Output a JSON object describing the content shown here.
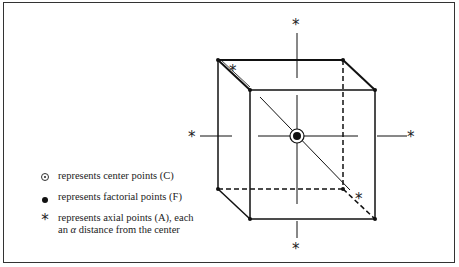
{
  "diagram": {
    "type": "central composite design cube",
    "center_point_label": "center",
    "axial_symbol": "*",
    "legend": [
      {
        "symbol": "center-point",
        "text": "represents center points (C)"
      },
      {
        "symbol": "factorial-point",
        "text": "represents factorial points (F)"
      },
      {
        "symbol": "axial-point",
        "line1": "represents axial points (A), each",
        "line2_prefix": "an ",
        "line2_alpha": "α",
        "line2_suffix": " distance from the center"
      }
    ]
  }
}
